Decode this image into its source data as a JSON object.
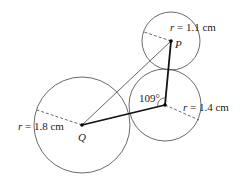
{
  "diagram": {
    "circles": [
      {
        "id": "Q",
        "label": "Q",
        "radius_label": "r = 1.8 cm",
        "r_var": "r",
        "r_value": "= 1.8 cm"
      },
      {
        "id": "P",
        "label": "P",
        "radius_label": "r = 1.1 cm",
        "r_var": "r",
        "r_value": "= 1.1 cm"
      },
      {
        "id": "M",
        "label": "",
        "radius_label": "r = 1.4 cm",
        "r_var": "r",
        "r_value": "= 1.4 cm"
      }
    ],
    "angle_label": "109°",
    "colors": {
      "stroke": "#333333",
      "thick": "#111111",
      "text": "#222222"
    }
  }
}
